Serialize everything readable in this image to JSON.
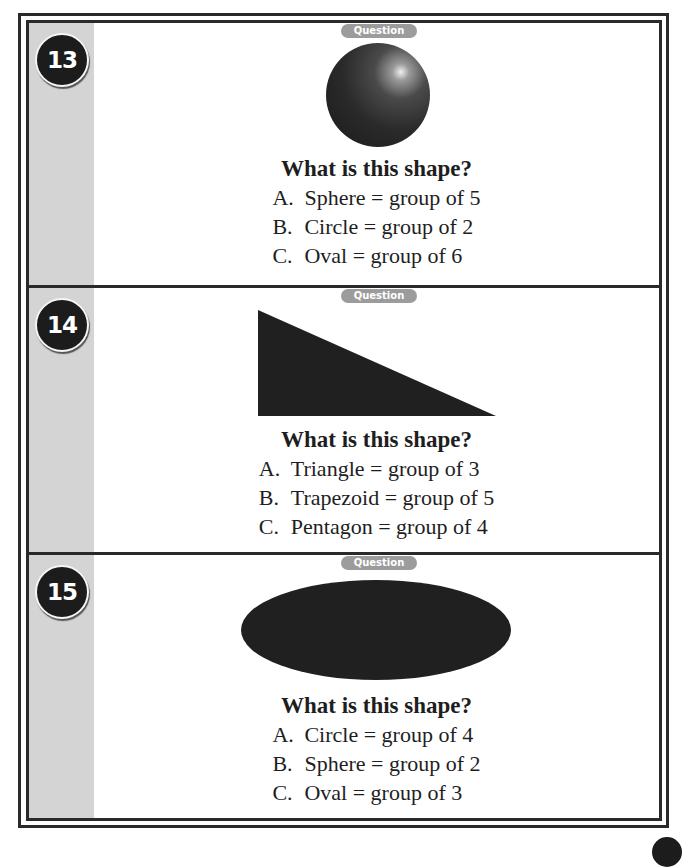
{
  "page": {
    "question_label": "Question",
    "questions": [
      {
        "number": "13",
        "shape": "sphere",
        "prompt": "What is this shape?",
        "options": [
          {
            "letter": "A.",
            "text": "Sphere = group of 5"
          },
          {
            "letter": "B.",
            "text": "Circle = group of 2"
          },
          {
            "letter": "C.",
            "text": "Oval = group of 6"
          }
        ]
      },
      {
        "number": "14",
        "shape": "right-triangle",
        "prompt": "What is this shape?",
        "options": [
          {
            "letter": "A.",
            "text": "Triangle = group of 3"
          },
          {
            "letter": "B.",
            "text": "Trapezoid = group of 5"
          },
          {
            "letter": "C.",
            "text": "Pentagon = group of 4"
          }
        ]
      },
      {
        "number": "15",
        "shape": "oval",
        "prompt": "What is this shape?",
        "options": [
          {
            "letter": "A.",
            "text": "Circle = group of 4"
          },
          {
            "letter": "B.",
            "text": "Sphere = group of 2"
          },
          {
            "letter": "C.",
            "text": "Oval = group of 3"
          }
        ]
      }
    ]
  },
  "colors": {
    "border": "#2a2a2a",
    "sidebar": "#d4d4d4",
    "badge": "#1c1c1c",
    "pill": "#9c9c9c",
    "shape_fill": "#202020"
  }
}
